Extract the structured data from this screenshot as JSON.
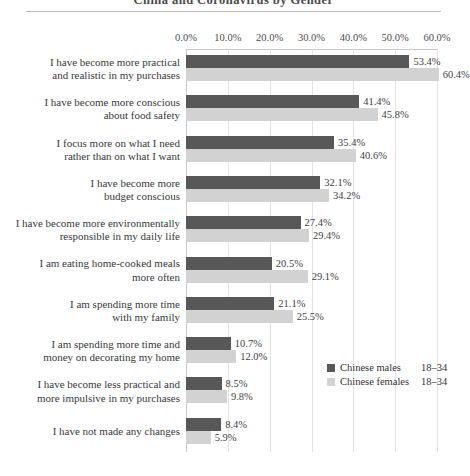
{
  "chart_data": {
    "type": "bar",
    "orientation": "horizontal",
    "title": "China and Coronavirus by Gender",
    "xlabel": "",
    "ylabel": "",
    "xlim": [
      0,
      60
    ],
    "xticks": [
      "0.0%",
      "10.0%",
      "20.0%",
      "30.0%",
      "40.0%",
      "50.0%",
      "60.0%"
    ],
    "xtick_values": [
      0,
      10,
      20,
      30,
      40,
      50,
      60
    ],
    "grid": true,
    "legend_position": "middle-right",
    "categories": [
      "I have become more practical\nand realistic in my purchases",
      "I have become more conscious\nabout food safety",
      "I focus more on what I need\nrather than on what I want",
      "I have become more\nbudget conscious",
      "I have become more environmentally\nresponsible in my daily life",
      "I am eating home-cooked meals\nmore often",
      "I am spending more time\nwith my family",
      "I am spending more time and\nmoney on decorating my home",
      "I have become less practical and\nmore impulsive in my purchases",
      "I have not made any changes"
    ],
    "series": [
      {
        "name": "Chinese males",
        "age": "18–34",
        "color": "#585858",
        "values": [
          53.4,
          41.4,
          35.4,
          32.1,
          27.4,
          20.5,
          21.1,
          10.7,
          8.5,
          8.4
        ],
        "labels": [
          "53.4%",
          "41.4%",
          "35.4%",
          "32.1%",
          "27.4%",
          "20.5%",
          "21.1%",
          "10.7%",
          "8.5%",
          "8.4%"
        ]
      },
      {
        "name": "Chinese females",
        "age": "18–34",
        "color": "#d2d2d2",
        "values": [
          60.4,
          45.8,
          40.6,
          34.2,
          29.4,
          29.1,
          25.5,
          12.0,
          9.8,
          5.9
        ],
        "labels": [
          "60.4%",
          "45.8%",
          "40.6%",
          "34.2%",
          "29.4%",
          "29.1%",
          "25.5%",
          "12.0%",
          "9.8%",
          "5.9%"
        ]
      }
    ]
  }
}
